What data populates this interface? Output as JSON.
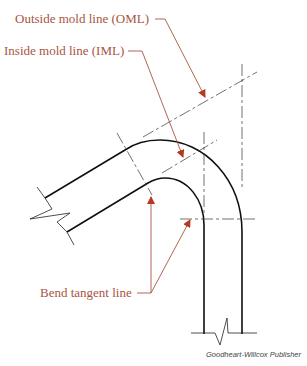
{
  "diagram": {
    "labels": {
      "oml": "Outside mold line (OML)",
      "iml": "Inside mold line (IML)",
      "btl": "Bend tangent line"
    },
    "credit": "Goodheart-Willcox Publisher",
    "colors": {
      "callout": "#a8553f",
      "arrowhead": "#b5391f",
      "line": "#111111",
      "centerline": "#333333"
    }
  }
}
